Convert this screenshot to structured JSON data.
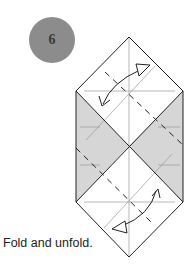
{
  "step": {
    "number": "6"
  },
  "caption": "Fold and unfold.",
  "colors": {
    "badge": "#8c8c8c",
    "shade": "#d6d6d6",
    "line": "#222222",
    "guide": "#9a9a9a"
  },
  "icons": {
    "fold-arrows": "double-headed curved arrow (fold and unfold)"
  }
}
